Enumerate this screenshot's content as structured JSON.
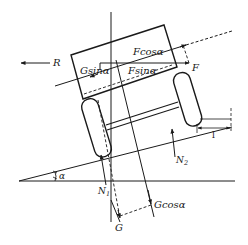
{
  "diagram": {
    "labels": {
      "R": "R",
      "G_sin": "Gsinα",
      "F_cos": "Fcosα",
      "F_sin": "Fsinα",
      "F": "F",
      "N1_base": "N",
      "N1_sub": "1",
      "N2_base": "N",
      "N2_sub": "2",
      "alpha": "α",
      "G": "G",
      "G_cos": "Gcosα",
      "dimension_l": "l"
    },
    "colors": {
      "line": "#1a1a1a",
      "background": "#ffffff"
    }
  }
}
